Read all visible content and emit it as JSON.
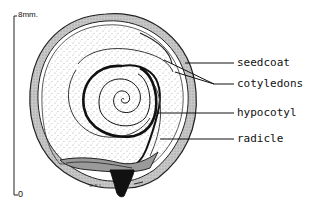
{
  "diagram": {
    "scale_bar": {
      "top_label": "8mm.",
      "bottom_label": "0"
    },
    "labels": [
      {
        "id": "seedcoat",
        "text": "seedcoat"
      },
      {
        "id": "cotyledons",
        "text": "cotyledons"
      },
      {
        "id": "hypocotyl",
        "text": "hypocotyl"
      },
      {
        "id": "radicle",
        "text": "radicle"
      }
    ],
    "artist_initials": "W.E.L.",
    "colors": {
      "ink": "#111111",
      "seedcoat_fill": "#bdbdbd",
      "background": "#ffffff"
    }
  }
}
